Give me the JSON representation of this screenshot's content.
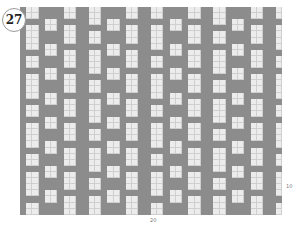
{
  "chart": {
    "number": "27",
    "bottom_label": "20",
    "right_label": "10",
    "cols": 42,
    "rows": 34,
    "cell_w": 6.24,
    "cell_h": 6.12,
    "colors": {
      "dark": "#8c8c8c",
      "light": "#ececec",
      "grid": "#cfcfcf"
    },
    "motif_width": 10,
    "motif_height": 8,
    "motif": [
      "1001111001",
      "1001111001",
      "1111001111",
      "1001001001",
      "1001111001",
      "1001111001",
      "1001001111",
      "1111001001"
    ]
  }
}
